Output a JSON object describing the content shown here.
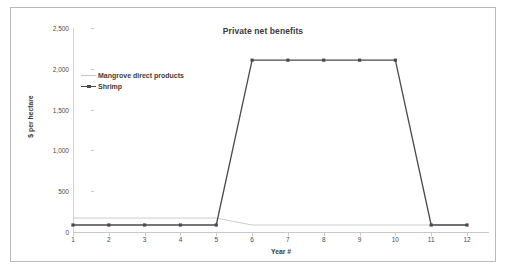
{
  "chart_data": {
    "type": "line",
    "title": "Private net benefits",
    "xlabel": "Year #",
    "ylabel": "$ per hectare",
    "x": [
      1,
      2,
      3,
      4,
      5,
      6,
      7,
      8,
      9,
      10,
      11,
      12
    ],
    "xtick_labels": [
      "1",
      "2",
      "3",
      "4",
      "5",
      "6",
      "7",
      "8",
      "9",
      "10",
      "11",
      "12"
    ],
    "ytick_labels": [
      "0",
      "500",
      "1,000",
      "1,500",
      "2,000",
      "2,500"
    ],
    "ytick_values": [
      0,
      500,
      1000,
      1500,
      2000,
      2500
    ],
    "ylim": [
      0,
      2500
    ],
    "xlim": [
      1,
      12
    ],
    "grid": false,
    "legend_position": "upper-left-inside",
    "series": [
      {
        "name": "Mangrove direct products",
        "color": "#c6c6c6",
        "marker": "none",
        "values": [
          85,
          85,
          85,
          85,
          85,
          0,
          0,
          0,
          0,
          0,
          0,
          0
        ]
      },
      {
        "name": "Shrimp",
        "color": "#4a4a4a",
        "marker": "square",
        "values": [
          0,
          0,
          0,
          0,
          0,
          2020,
          2020,
          2020,
          2020,
          2020,
          0,
          0
        ]
      }
    ]
  },
  "colors": {
    "frame": "#b9b9b9",
    "axis": "#c9c9c9",
    "text": "#3a3a3a",
    "background": "#ffffff"
  }
}
